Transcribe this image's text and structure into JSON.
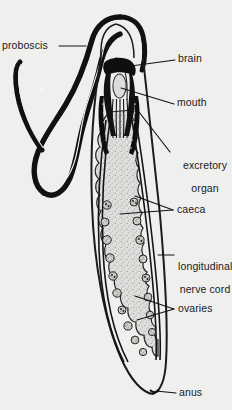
{
  "figure": {
    "background_color": "#efefee",
    "ink_color": "#141414",
    "gut_fill_color": "#d9d9d7"
  },
  "labels": {
    "proboscis": "proboscis",
    "brain": "brain",
    "mouth": "mouth",
    "excretory_organ_line1": "excretory",
    "excretory_organ_line2": "organ",
    "caeca": "caeca",
    "nerve_cord_line1": "longitudinal",
    "nerve_cord_line2": "nerve cord",
    "ovaries": "ovaries",
    "anus": "anus"
  },
  "structures": [
    {
      "name": "proboscis",
      "description": "long thick dark coiled tube looping at upper left"
    },
    {
      "name": "brain",
      "description": "dark mass at anterior end of body"
    },
    {
      "name": "mouth",
      "description": "oval cavity just posterior to brain"
    },
    {
      "name": "excretory-organ",
      "description": "paired dark elongate organs flanking the pharynx"
    },
    {
      "name": "caeca",
      "description": "lateral lobed pouches of the stippled gut"
    },
    {
      "name": "longitudinal-nerve-cord",
      "description": "paired lines running the length of the body"
    },
    {
      "name": "ovaries",
      "description": "small rounded bodies between caeca"
    },
    {
      "name": "anus",
      "description": "terminal opening at posterior tip"
    }
  ]
}
